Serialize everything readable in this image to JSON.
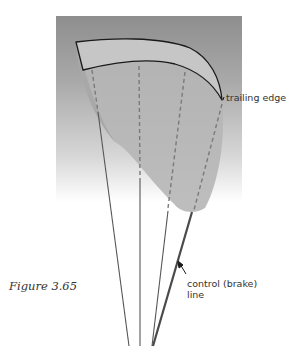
{
  "figure": {
    "caption": "Figure 3.65",
    "labels": {
      "trailing_edge": "trailing edge",
      "control_line_1": "control (brake)",
      "control_line_2": "line"
    },
    "top_fragment": "· · · ·"
  },
  "colors": {
    "background_top": "#8e8e8e",
    "canopy_fill": "#b8b8b8",
    "airfoil_fill": "#c4c4c4",
    "outline": "#1a1a1a",
    "line": "#555555",
    "dashed": "#777777",
    "text": "#333333"
  }
}
